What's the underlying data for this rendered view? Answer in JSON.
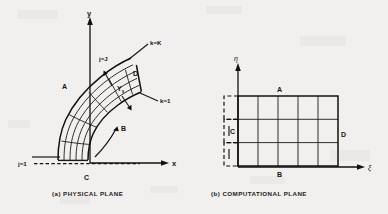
{
  "figure": {
    "background_color": "#f2f0ee",
    "ink_color": "#1a1a1a",
    "panels": [
      {
        "id": "physical-plane",
        "caption": "(a) PHYSICAL PLANE",
        "axes": {
          "x_label": "x",
          "y_label": "y"
        },
        "labels": [
          {
            "name": "k-max-label",
            "text": "k=K"
          },
          {
            "name": "k-min-label",
            "text": "k=1"
          },
          {
            "name": "j-max-label",
            "text": "j=J"
          },
          {
            "name": "j-min-label",
            "text": "j=1"
          },
          {
            "name": "corner-a-label",
            "text": "A"
          },
          {
            "name": "corner-b-label",
            "text": "B"
          },
          {
            "name": "corner-c-label",
            "text": "C"
          },
          {
            "name": "corner-d-label",
            "text": "D"
          },
          {
            "name": "gamma-s-label",
            "text": "Y",
            "subscript": "s"
          }
        ],
        "grid": {
          "j_lines": 5,
          "k_lines": 6,
          "type": "curvilinear-body-fitted"
        }
      },
      {
        "id": "computational-plane",
        "caption": "(b) COMPUTATIONAL PLANE",
        "axes": {
          "x_label": "ξ",
          "y_label": "η"
        },
        "labels": [
          {
            "name": "corner-a-label",
            "text": "A"
          },
          {
            "name": "corner-b-label",
            "text": "B"
          },
          {
            "name": "corner-c-label",
            "text": "C"
          },
          {
            "name": "corner-d-label",
            "text": "D"
          }
        ],
        "grid": {
          "columns": 5,
          "rows": 3,
          "type": "rectangular-uniform"
        }
      }
    ]
  }
}
